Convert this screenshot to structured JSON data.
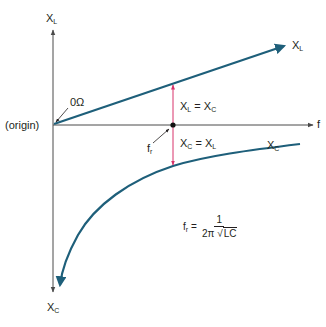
{
  "diagram": {
    "colors": {
      "axis": "#4a4a4a",
      "curve": "#1e5f7a",
      "resonance_marker": "#d8336a",
      "text": "#231f20"
    },
    "axes": {
      "y_top_label": "X",
      "y_top_sub": "L",
      "y_bottom_label": "X",
      "y_bottom_sub": "C",
      "x_label": "f",
      "origin_label": "(origin)"
    },
    "annotations": {
      "zero_ohm": "0Ω",
      "fr_pointer": "f",
      "fr_pointer_sub": "r",
      "xl_curve_label": "X",
      "xl_curve_sub": "L",
      "xc_curve_label": "X",
      "xc_curve_sub": "C",
      "eq_upper": {
        "a": "X",
        "a_sub": "L",
        "op": " = ",
        "b": "X",
        "b_sub": "C"
      },
      "eq_lower": {
        "a": "X",
        "a_sub": "C",
        "op": " = ",
        "b": "X",
        "b_sub": "L"
      }
    },
    "formula": {
      "lhs": "f",
      "lhs_sub": "r",
      "equals": " = ",
      "numerator": "1",
      "denominator_prefix": "2π ",
      "radicand": "LC"
    }
  }
}
